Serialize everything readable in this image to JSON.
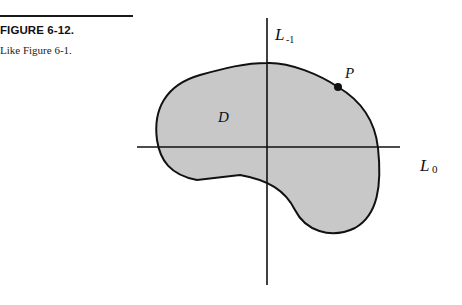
{
  "figure": {
    "number_label": "FIGURE 6-12.",
    "caption": "Like Figure 6-1."
  },
  "diagram": {
    "region_label": "D",
    "point_label": "P",
    "vertical_axis": {
      "label": "L",
      "subscript": "-1"
    },
    "horizontal_axis": {
      "label": "L",
      "subscript": "0"
    },
    "colors": {
      "region_fill": "#c8c8c8",
      "stroke": "#111111",
      "background": "#ffffff"
    }
  }
}
